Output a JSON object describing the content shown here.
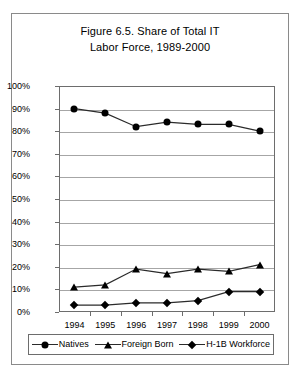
{
  "figure": {
    "title_lines": [
      "Figure 6.5. Share of Total IT",
      "Labor Force, 1989-2000"
    ]
  },
  "chart_data": {
    "type": "line",
    "title": "Figure 6.5. Share of Total IT Labor Force, 1989-2000",
    "xlabel": "",
    "ylabel": "",
    "categories": [
      "1994",
      "1995",
      "1996",
      "1997",
      "1998",
      "1999",
      "2000"
    ],
    "ylim": [
      0,
      100
    ],
    "ytick_labels": [
      "100%",
      "90%",
      "80%",
      "70%",
      "60%",
      "50%",
      "40%",
      "30%",
      "20%",
      "10%",
      "0%"
    ],
    "ytick_values": [
      100,
      90,
      80,
      70,
      60,
      50,
      40,
      30,
      20,
      10,
      0
    ],
    "grid": true,
    "legend_position": "bottom",
    "series": [
      {
        "name": "Natives",
        "marker": "circle",
        "values": [
          90,
          88,
          82,
          84,
          83,
          83,
          80
        ]
      },
      {
        "name": "Foreign Born",
        "marker": "triangle",
        "values": [
          11,
          12,
          19,
          17,
          19,
          18,
          21
        ]
      },
      {
        "name": "H-1B Workforce",
        "marker": "diamond",
        "values": [
          3,
          3,
          4,
          4,
          5,
          9,
          9
        ]
      }
    ]
  }
}
